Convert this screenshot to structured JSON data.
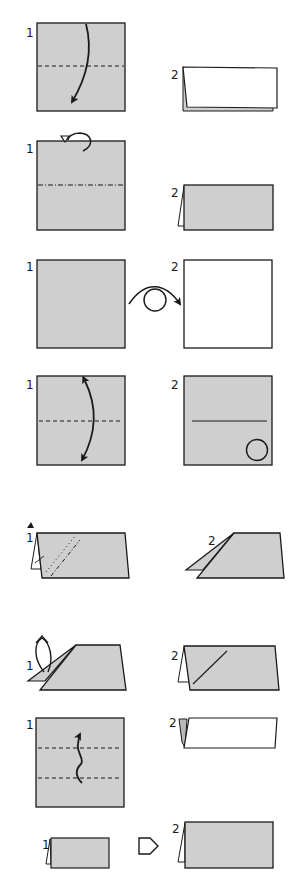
{
  "colors": {
    "paper_gray": "#cfcfcf",
    "paper_white": "#ffffff",
    "line": "#1a1a1a",
    "background": "#ffffff"
  },
  "rows": [
    {
      "name": "valley-fold-in-half",
      "step_labels": [
        "1",
        "2"
      ],
      "icons": [
        "valley-fold-dashed-line",
        "fold-down-arrow"
      ]
    },
    {
      "name": "mountain-fold-in-half",
      "step_labels": [
        "1",
        "2"
      ],
      "icons": [
        "mountain-fold-dash-dot-line",
        "fold-behind-arrow"
      ]
    },
    {
      "name": "turn-over",
      "step_labels": [
        "1",
        "2"
      ],
      "icons": [
        "turn-over-arrow"
      ]
    },
    {
      "name": "fold-and-unfold",
      "step_labels": [
        "1",
        "2"
      ],
      "icons": [
        "valley-fold-dashed-line",
        "fold-unfold-arrow",
        "crease-line",
        "circle-marker"
      ]
    },
    {
      "name": "inside-reverse-fold",
      "step_labels": [
        "1",
        "2"
      ],
      "icons": [
        "push-arrow",
        "dotted-line",
        "dash-dot-line"
      ]
    },
    {
      "name": "unfold",
      "step_labels": [
        "1",
        "2"
      ],
      "icons": [
        "unfold-arrow",
        "crease-line"
      ]
    },
    {
      "name": "pleat-fold",
      "step_labels": [
        "1",
        "2"
      ],
      "icons": [
        "valley-fold-dashed-line",
        "pleat-arrow"
      ]
    },
    {
      "name": "enlarged-view",
      "step_labels": [
        "1",
        "2"
      ],
      "icons": [
        "enlarge-arrow"
      ]
    }
  ]
}
